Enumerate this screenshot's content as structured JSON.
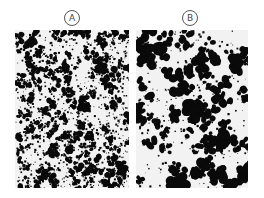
{
  "figure": {
    "panels": [
      {
        "label": "A",
        "texture": "fine",
        "description": "fine-grained black speckle micrograph"
      },
      {
        "label": "B",
        "texture": "coarse",
        "description": "coarse-grained black clump micrograph"
      }
    ],
    "colors": {
      "background": "#ffffff",
      "panel_bg": "#f2f2f2",
      "ink": "#0a0a0a",
      "label_stroke": "#555555"
    }
  }
}
